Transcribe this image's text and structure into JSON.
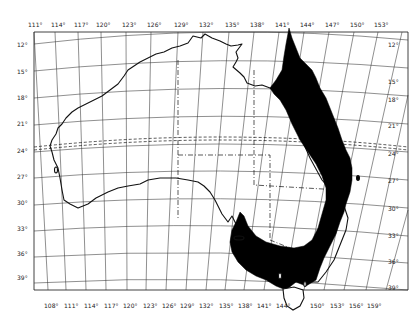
{
  "map": {
    "region": "Australia",
    "projection_graticule_step_deg": 3,
    "colors": {
      "background": "#ffffff",
      "lines": "#111111",
      "shaded_region": "#000000"
    },
    "top_longitude_labels": [
      "111°",
      "114°",
      "117°",
      "120°",
      "123°",
      "126°",
      "129°",
      "132°",
      "135°",
      "138°",
      "141°",
      "144°",
      "147°",
      "150°",
      "153°"
    ],
    "bottom_longitude_labels": [
      "108°",
      "111°",
      "114°",
      "117°",
      "120°",
      "123°",
      "126°",
      "129°",
      "132°",
      "135°",
      "138°",
      "141°",
      "144°",
      "150°",
      "153°",
      "156°",
      "159°"
    ],
    "left_latitude_labels": [
      "12°",
      "15°",
      "18°",
      "21°",
      "24°",
      "27°",
      "30°",
      "33°",
      "36°",
      "39°"
    ],
    "right_latitude_labels": [
      "12°",
      "15°",
      "18°",
      "21°",
      "24°",
      "27°",
      "30°",
      "33°",
      "36°",
      "39°"
    ],
    "features": {
      "tropic_line": "Tropic of Capricorn (dashed)",
      "state_borders": "dash-dot lines",
      "shaded_area": "Eastern coastal belt (Queensland, NSW, Victoria, SE South Australia)",
      "islands": [
        "Tasmania",
        "Kangaroo Island",
        "Fraser Island"
      ]
    }
  }
}
